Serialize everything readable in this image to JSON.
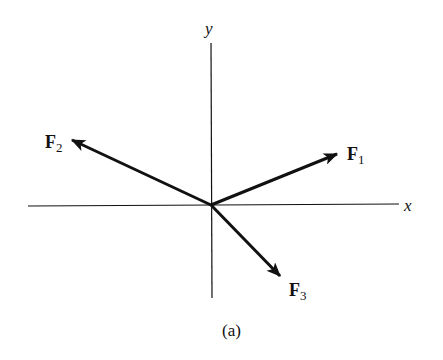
{
  "diagram": {
    "axes": {
      "x_label": "x",
      "y_label": "y"
    },
    "vectors": [
      {
        "name": "F",
        "subscript": "1",
        "direction": "up-right"
      },
      {
        "name": "F",
        "subscript": "2",
        "direction": "up-left"
      },
      {
        "name": "F",
        "subscript": "3",
        "direction": "down-right"
      }
    ],
    "caption": "(a)",
    "colors": {
      "line": "#111111",
      "background": "#ffffff"
    }
  }
}
